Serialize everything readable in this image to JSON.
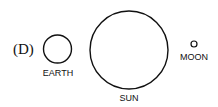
{
  "option_label": "(D)",
  "bodies": [
    {
      "name": "EARTH",
      "cx": 57.5,
      "cy": 49,
      "r": 14,
      "label_x": 58,
      "label_y": 76
    },
    {
      "name": "SUN",
      "cx": 129,
      "cy": 50,
      "r": 39,
      "label_x": 129,
      "label_y": 101
    },
    {
      "name": "MOON",
      "cx": 194,
      "cy": 44,
      "r": 3,
      "label_x": 194,
      "label_y": 60
    }
  ],
  "stroke_color": "#111111"
}
